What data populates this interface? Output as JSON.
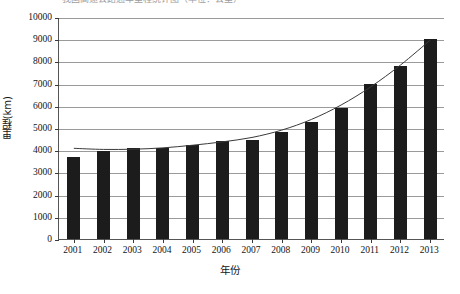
{
  "chart_data": {
    "type": "bar",
    "title": "我国高速公路通车里程统计图（单位：公里）",
    "xlabel": "年份",
    "ylabel": "里程(km)",
    "categories": [
      "2001",
      "2002",
      "2003",
      "2004",
      "2005",
      "2006",
      "2007",
      "2008",
      "2009",
      "2010",
      "2011",
      "2012",
      "2013"
    ],
    "values": [
      3700,
      3950,
      4100,
      4100,
      4250,
      4400,
      4450,
      4800,
      5250,
      5900,
      7000,
      7800,
      9000
    ],
    "series": [
      {
        "name": "里程(km)",
        "type": "bar",
        "values": [
          3700,
          3950,
          4100,
          4100,
          4250,
          4400,
          4450,
          4800,
          5250,
          5900,
          7000,
          7800,
          9000
        ]
      },
      {
        "name": "趋势线",
        "type": "line",
        "values": [
          4130,
          4080,
          4090,
          4150,
          4270,
          4420,
          4620,
          4950,
          5430,
          6080,
          6900,
          7880,
          9000
        ]
      }
    ],
    "ylim": [
      0,
      10000
    ],
    "yticks": [
      0,
      1000,
      2000,
      3000,
      4000,
      5000,
      6000,
      7000,
      8000,
      9000,
      10000
    ],
    "ytick_labels": [
      "0",
      "1000",
      "2000",
      "3000",
      "4000",
      "5000",
      "6000",
      "7000",
      "8000",
      "9000",
      "10000"
    ],
    "grid": true,
    "legend": false,
    "bar_color": "#1c1c1c",
    "grid_color": "#9a9a9a",
    "axis_color": "#555555",
    "trend_color": "#3a3a3a"
  }
}
